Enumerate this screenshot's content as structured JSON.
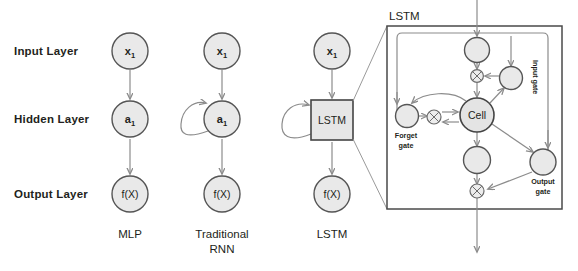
{
  "diagram": {
    "title_hidden": "",
    "row_labels": [
      {
        "id": "input-layer",
        "text": "Input Layer",
        "y": 51
      },
      {
        "id": "hidden-layer",
        "text": "Hidden Layer",
        "y": 119
      },
      {
        "id": "output-layer",
        "text": "Output Layer",
        "y": 194
      }
    ],
    "columns": [
      {
        "id": "mlp",
        "caption": "MLP",
        "caption_line2": ""
      },
      {
        "id": "traditional-rnn",
        "caption": "Traditional",
        "caption_line2": "RNN"
      },
      {
        "id": "lstm",
        "caption": "LSTM",
        "caption_line2": ""
      }
    ],
    "mlp": {
      "input_node": "x",
      "input_node_sub": "1",
      "hidden_node": "a",
      "hidden_node_sub": "1",
      "output_node": "f(X)"
    },
    "rnn": {
      "input_node": "x",
      "input_node_sub": "1",
      "hidden_node": "a",
      "hidden_node_sub": "1",
      "output_node": "f(X)",
      "has_recurrent_loop": true
    },
    "lstm_column": {
      "input_node": "x",
      "input_node_sub": "1",
      "cell_box_label": "LSTM",
      "output_node": "f(X)",
      "has_recurrent_loop": true
    },
    "lstm_detail": {
      "title": "LSTM",
      "cell_label": "Cell",
      "forget_gate_line1": "Forget",
      "forget_gate_line2": "gate",
      "input_gate_label": "Input gate",
      "output_gate_line1": "Output",
      "output_gate_line2": "gate",
      "operator_symbol": "x"
    },
    "colors": {
      "node_fill": "#e9e9e9",
      "node_stroke": "#555555",
      "connector": "#8c8c8c",
      "box_stroke": "#444444",
      "text": "#231f20",
      "background": "#ffffff"
    }
  }
}
